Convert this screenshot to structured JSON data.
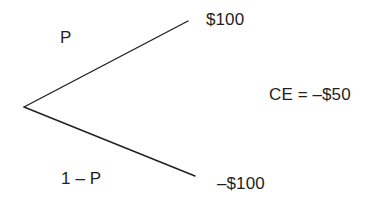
{
  "diagram": {
    "type": "lottery-decision-tree",
    "background_color": "#ffffff",
    "stroke_color": "#231f20",
    "text_color": "#231f20",
    "node": {
      "name": "chance-node",
      "x": 24,
      "y": 107
    },
    "branches": [
      {
        "name": "upside-branch",
        "probability_label": "P",
        "payoff_label": "$100",
        "end_x": 188,
        "end_y": 21
      },
      {
        "name": "downside-branch",
        "probability_label": "1 – P",
        "payoff_label": "–$100",
        "end_x": 195,
        "end_y": 176
      }
    ],
    "annotation": {
      "name": "certainty-equivalent",
      "text": "CE = –$50"
    }
  }
}
